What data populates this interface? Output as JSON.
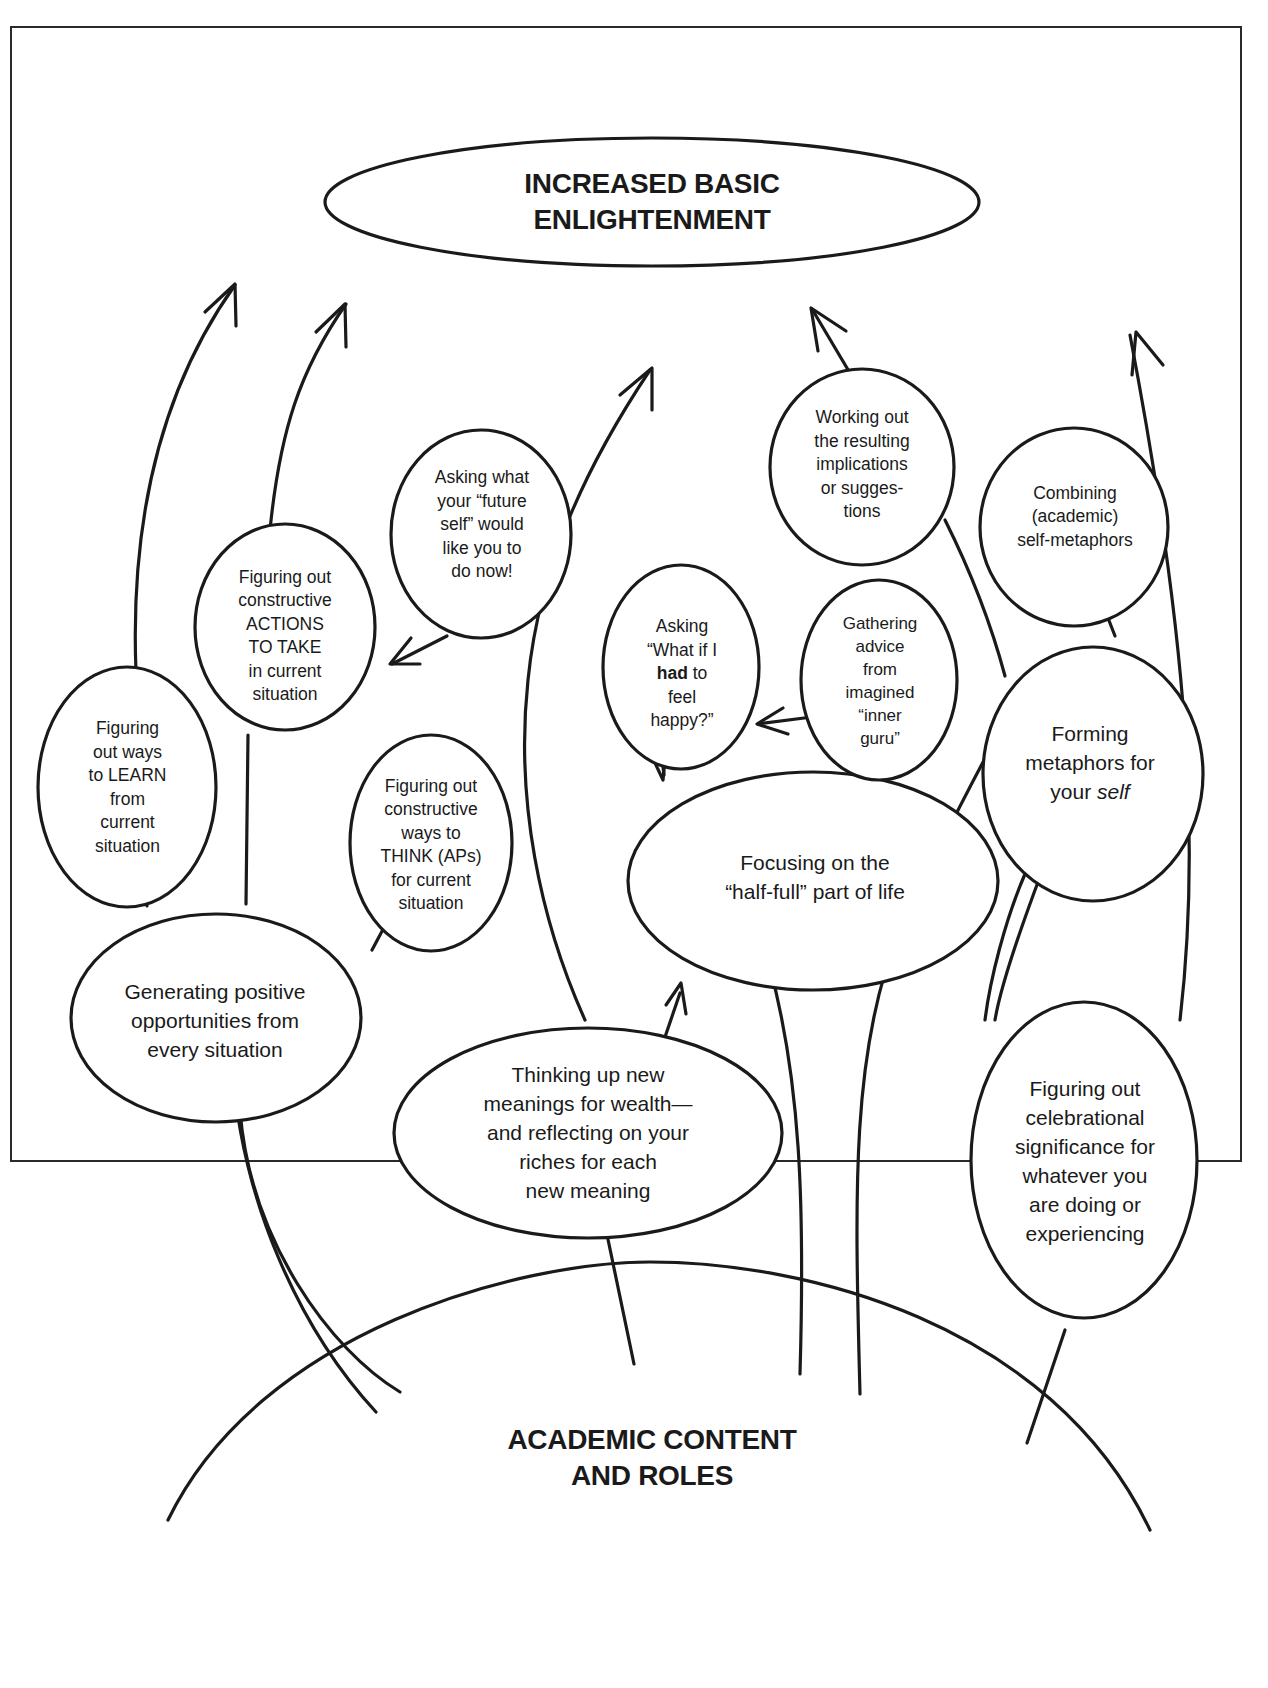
{
  "diagram": {
    "colors": {
      "ink": "#1a1a1a",
      "background": "#ffffff"
    },
    "top_goal": {
      "lines": [
        "INCREASED BASIC",
        "ENLIGHTENMENT"
      ]
    },
    "base": {
      "lines": [
        "ACADEMIC CONTENT",
        "AND ROLES"
      ]
    },
    "nodes": {
      "generating": {
        "lines": [
          "Generating positive",
          "opportunities from",
          "every situation"
        ]
      },
      "learn": {
        "lines": [
          "Figuring",
          "out ways",
          "to LEARN",
          "from",
          "current",
          "situation"
        ]
      },
      "actions": {
        "lines": [
          "Figuring out",
          "constructive",
          "ACTIONS",
          "TO TAKE",
          "in current",
          "situation"
        ]
      },
      "future_self": {
        "lines": [
          "Asking what",
          "your “future",
          "self” would",
          "like you to",
          "do now!"
        ]
      },
      "think": {
        "lines": [
          "Figuring out",
          "constructive",
          "ways to",
          "THINK (APs)",
          "for current",
          "situation"
        ]
      },
      "wealth": {
        "lines": [
          "Thinking up new",
          "meanings for wealth—",
          "and reflecting on your",
          "riches for each",
          "new meaning"
        ]
      },
      "half_full": {
        "lines": [
          "Focusing on the",
          "“half-full” part of life"
        ]
      },
      "had_to": {
        "pre": "Asking",
        "line2": "“What if I",
        "bold": "had",
        "after_bold": " to",
        "line4": "feel",
        "line5": "happy?”"
      },
      "inner_guru": {
        "lines": [
          "Gathering",
          "advice",
          "from",
          "imagined",
          "“inner",
          "guru”"
        ]
      },
      "implications": {
        "lines": [
          "Working out",
          "the resulting",
          "implications",
          "or sugges-",
          "tions"
        ]
      },
      "combining": {
        "lines": [
          "Combining",
          "(academic)",
          "self-metaphors"
        ]
      },
      "metaphors": {
        "line1": "Forming",
        "line2": "metaphors for",
        "line3_pre": "your ",
        "line3_italic": "self"
      },
      "celebrational": {
        "lines": [
          "Figuring out",
          "celebrational",
          "significance for",
          "whatever you",
          "are doing or",
          "experiencing"
        ]
      }
    },
    "arrows_to_goal": 5,
    "internal_arrows": [
      "future_self -> actions",
      "inner_guru -> had_to",
      "had_to -> half_full",
      "wealth -> half_full"
    ]
  }
}
